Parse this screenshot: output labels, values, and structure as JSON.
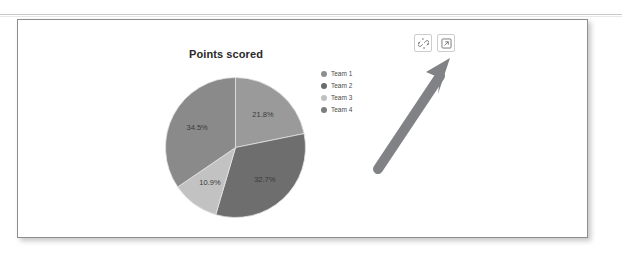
{
  "panel": {
    "name": "chart-panel"
  },
  "toolbar": {
    "buttons": [
      {
        "name": "unlink-icon",
        "label": "Unlink"
      },
      {
        "name": "external-link-icon",
        "label": "Open in new window"
      }
    ]
  },
  "annotation": {
    "arrow_name": "pointer-arrow",
    "arrow_color": "#808285",
    "points_to": "external-link-icon"
  },
  "chart_data": {
    "type": "pie",
    "title": "Points scored",
    "xlabel": "",
    "ylabel": "",
    "legend_position": "right",
    "grid": false,
    "categories": [
      "Team 1",
      "Team 2",
      "Team 3",
      "Team 4"
    ],
    "values": [
      21.8,
      32.7,
      10.9,
      34.5
    ],
    "value_labels": [
      "21.8%",
      "32.7%",
      "10.9%",
      "34.5%"
    ],
    "colors": [
      "#9a9a9a",
      "#6e6e6e",
      "#c2c2c2",
      "#8a8a8a"
    ],
    "legend_colors": [
      "#8e8e8e",
      "#6b6b6b",
      "#c0c0c0",
      "#7d7d7d"
    ],
    "start_angle": 0,
    "direction": "clockwise"
  }
}
